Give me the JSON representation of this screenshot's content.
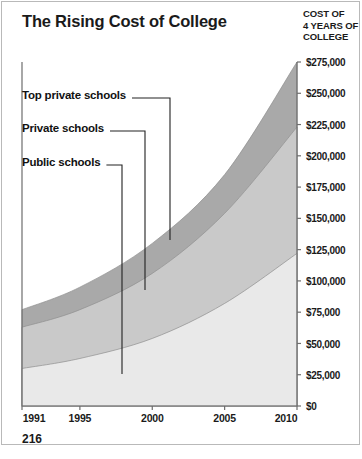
{
  "title": "The Rising Cost of College",
  "page_number": "216",
  "axis_title": {
    "line1": "COST OF",
    "line2": "4 YEARS OF",
    "line3": "COLLEGE"
  },
  "callouts": [
    {
      "label": "Top private schools",
      "series": "top_private"
    },
    {
      "label": "Private schools",
      "series": "private"
    },
    {
      "label": "Public schools",
      "series": "public"
    }
  ],
  "colors": {
    "top_private": "#a9a9a9",
    "private": "#c9c9c9",
    "public": "#e9e9e9",
    "axis": "#6e6e6e",
    "text": "#1a1a1a",
    "leader_line": "#222222",
    "border": "#b9b9b9",
    "background": "#ffffff"
  },
  "chart_data": {
    "type": "area",
    "title": "The Rising Cost of College",
    "subtitle": "",
    "xlabel": "",
    "ylabel": "COST OF 4 YEARS OF COLLEGE",
    "stacked": false,
    "grid": false,
    "legend": "callout-labels-with-leader-lines",
    "xlim": [
      1991,
      2010
    ],
    "ylim": [
      0,
      275000
    ],
    "xticks": [
      1991,
      1995,
      2000,
      2005,
      2010
    ],
    "xtick_labels": [
      "1991",
      "1995",
      "2000",
      "2005",
      "2010"
    ],
    "yticks": [
      0,
      25000,
      50000,
      75000,
      100000,
      125000,
      150000,
      175000,
      200000,
      225000,
      250000,
      275000
    ],
    "ytick_labels": [
      "$0",
      "$25,000",
      "$50,000",
      "$75,000",
      "$100,000",
      "$125,000",
      "$150,000",
      "$175,000",
      "$200,000",
      "$225,000",
      "$250,000",
      "$275,000"
    ],
    "x": [
      1991,
      1995,
      2000,
      2005,
      2010
    ],
    "series": [
      {
        "name": "Top private schools",
        "key": "top_private",
        "color": "#a9a9a9",
        "values": [
          77000,
          95000,
          130000,
          185000,
          275000
        ]
      },
      {
        "name": "Private schools",
        "key": "private",
        "color": "#c9c9c9",
        "values": [
          63000,
          77000,
          106000,
          154000,
          223000
        ]
      },
      {
        "name": "Public schools",
        "key": "public",
        "color": "#e9e9e9",
        "values": [
          30000,
          38000,
          54000,
          82000,
          122000
        ]
      }
    ]
  }
}
